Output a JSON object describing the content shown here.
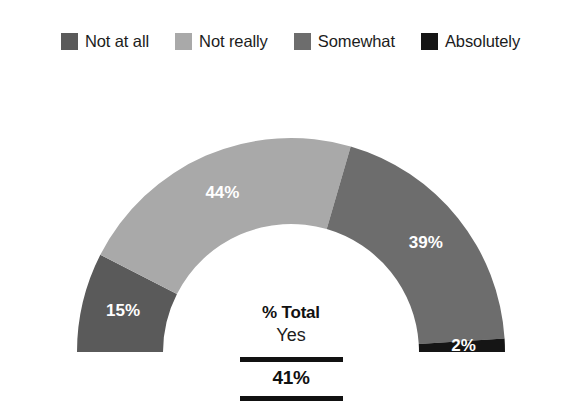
{
  "legend": {
    "items": [
      {
        "label": "Not at all",
        "color": "#5a5a5a",
        "swatch_name": "legend-swatch-not-at-all"
      },
      {
        "label": "Not really",
        "color": "#a9a9a9",
        "swatch_name": "legend-swatch-not-really"
      },
      {
        "label": "Somewhat",
        "color": "#6d6d6d",
        "swatch_name": "legend-swatch-somewhat"
      },
      {
        "label": "Absolutely",
        "color": "#151515",
        "swatch_name": "legend-swatch-absolutely"
      }
    ]
  },
  "center": {
    "title": "% Total",
    "subtitle": "Yes",
    "value": "41%"
  },
  "labels": {
    "not_at_all": "15%",
    "not_really": "44%",
    "somewhat": "39%",
    "absolutely": "2%"
  },
  "chart_data": {
    "type": "pie",
    "variant": "half-donut-gauge",
    "title": "",
    "subtitle": "",
    "xlabel": "",
    "ylabel": "",
    "legend_position": "top",
    "grid": false,
    "start_angle_deg": 180,
    "end_angle_deg": 360,
    "direction": "clockwise",
    "inner_radius_ratio": 0.6,
    "units": "percent",
    "total": 100,
    "categories": [
      "Not at all",
      "Not really",
      "Somewhat",
      "Absolutely"
    ],
    "values": [
      15,
      44,
      39,
      2
    ],
    "value_labels": [
      "15%",
      "44%",
      "39%",
      "2%"
    ],
    "colors": [
      "#5a5a5a",
      "#a9a9a9",
      "#6d6d6d",
      "#151515"
    ],
    "annotations": [
      {
        "text": "% Total",
        "position": "center",
        "style": "bold"
      },
      {
        "text": "Yes",
        "position": "center",
        "style": "regular"
      },
      {
        "text": "41%",
        "position": "center",
        "style": "bold"
      }
    ],
    "summary": {
      "label": "% Total Yes",
      "value": 41,
      "value_label": "41%",
      "note": "Somewhat + Absolutely = 41%"
    }
  }
}
